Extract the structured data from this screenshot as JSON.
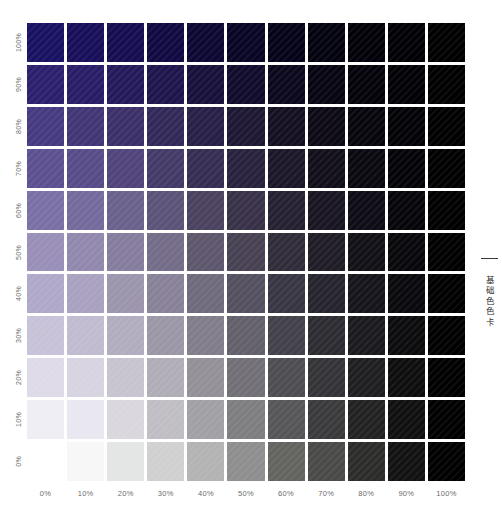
{
  "caption": {
    "text": "基础色色卡",
    "rule": "horizontal-rule"
  },
  "chart_data": {
    "type": "heatmap",
    "title": "基础色色卡",
    "xlabel": "",
    "ylabel": "",
    "grid": false,
    "legend_position": "none",
    "rows": 11,
    "columns": 11,
    "x_axis_name": "black-overprint-percent",
    "y_axis_name": "base-color-tint-percent",
    "categories": [
      "0%",
      "10%",
      "20%",
      "30%",
      "40%",
      "50%",
      "60%",
      "70%",
      "80%",
      "90%",
      "100%"
    ],
    "row_categories": [
      "100%",
      "90%",
      "80%",
      "70%",
      "60%",
      "50%",
      "40%",
      "30%",
      "20%",
      "10%",
      "0%"
    ],
    "base_color": "#161060",
    "overprint_color": "#000000",
    "background": "#ffffff",
    "gutter_color": "#ffffff",
    "series": [
      {
        "name": "100%",
        "values": [
          "#191263",
          "#180f5a",
          "#150d4f",
          "#110a42",
          "#0c0733",
          "#080525",
          "#050318",
          "#03020f",
          "#020109",
          "#010005",
          "#000000"
        ]
      },
      {
        "name": "90%",
        "values": [
          "#2b1f6e",
          "#281d66",
          "#241a5b",
          "#1e164c",
          "#17113c",
          "#110c2c",
          "#0b081d",
          "#070512",
          "#04030b",
          "#020106",
          "#000000"
        ]
      },
      {
        "name": "80%",
        "values": [
          "#463a80",
          "#423676",
          "#3c3069",
          "#332959",
          "#282046",
          "#1e1833",
          "#141022",
          "#0d0a16",
          "#07060d",
          "#030207",
          "#000000"
        ]
      },
      {
        "name": "70%",
        "values": [
          "#5d5091",
          "#584c88",
          "#50447a",
          "#443a68",
          "#362e52",
          "#28223d",
          "#1b1729",
          "#120f1b",
          "#0a0810",
          "#040308",
          "#000000"
        ]
      },
      {
        "name": "60%",
        "values": [
          "#7b70a5",
          "#756a9c",
          "#6b618d",
          "#5c5378",
          "#4a425f",
          "#383148",
          "#262132",
          "#191522",
          "#0e0c14",
          "#06050a",
          "#000000"
        ]
      },
      {
        "name": "50%",
        "values": [
          "#998fb8",
          "#9288ae",
          "#867d9e",
          "#746c88",
          "#5e576d",
          "#474153",
          "#302c39",
          "#201d27",
          "#131118",
          "#08070c",
          "#000000"
        ]
      },
      {
        "name": "40%",
        "values": [
          "#b0a8c8",
          "#a9a1bf",
          "#9c95ad",
          "#888198",
          "#6f6a7c",
          "#545060",
          "#393643",
          "#26242d",
          "#16151b",
          "#0a090d",
          "#000000"
        ]
      },
      {
        "name": "30%",
        "values": [
          "#c8c2d8",
          "#c1bbd0",
          "#b2adbe",
          "#9c97a7",
          "#817d8a",
          "#63606b",
          "#434149",
          "#2d2c32",
          "#1b1a1e",
          "#0c0c0e",
          "#000000"
        ]
      },
      {
        "name": "20%",
        "values": [
          "#dedae8",
          "#d7d3e0",
          "#c7c4cf",
          "#b0adb7",
          "#939098",
          "#727076",
          "#4e4d51",
          "#343337",
          "#1f1f21",
          "#0e0e0f",
          "#000000"
        ]
      },
      {
        "name": "10%",
        "values": [
          "#f0eef5",
          "#e9e7ef",
          "#d9d7dd",
          "#c0bec4",
          "#a1a0a4",
          "#7e7d80",
          "#565557",
          "#3a393b",
          "#232223",
          "#101010",
          "#000000"
        ]
      },
      {
        "name": "0%",
        "values": [
          "#ffffff",
          "#f7f7f7",
          "#e3e6e5",
          "#cfd0cf",
          "#b2b3b2",
          "#8d8e8d",
          "#63645f",
          "#4a4a48",
          "#2c2c2b",
          "#121212",
          "#000000"
        ]
      }
    ]
  }
}
